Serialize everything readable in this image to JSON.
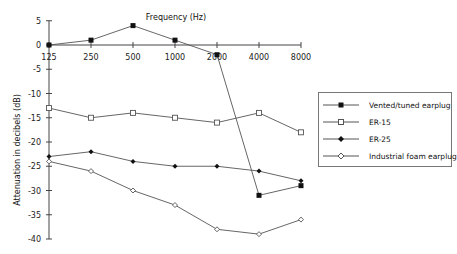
{
  "chart_data": {
    "type": "line",
    "title": "Frequency (Hz)",
    "xlabel": "Frequency (Hz)",
    "ylabel": "Attenuation in decibels (dB)",
    "categories": [
      "125",
      "250",
      "500",
      "1000",
      "2000",
      "4000",
      "8000"
    ],
    "y_ticks": [
      "5",
      "0",
      "-5",
      "-10",
      "-15",
      "-20",
      "-25",
      "-30",
      "-35",
      "-40"
    ],
    "ylim": [
      -40,
      5
    ],
    "grid": false,
    "legend_position": "right",
    "series": [
      {
        "name": "Vented/tuned earplug",
        "marker": "filled-square",
        "values": [
          0,
          1,
          4,
          1,
          -2,
          -31,
          -29
        ]
      },
      {
        "name": "ER-15",
        "marker": "open-square",
        "values": [
          -13,
          -15,
          -14,
          -15,
          -16,
          -14,
          -18
        ]
      },
      {
        "name": "ER-25",
        "marker": "filled-diamond",
        "values": [
          -23,
          -22,
          -24,
          -25,
          -25,
          -26,
          -28
        ]
      },
      {
        "name": "Industrial foam earplug",
        "marker": "open-diamond",
        "values": [
          -24,
          -26,
          -30,
          -33,
          -38,
          -39,
          -36
        ]
      }
    ]
  },
  "legend": {
    "items": [
      {
        "label": "Vented/tuned earplug"
      },
      {
        "label": "ER-15"
      },
      {
        "label": "ER-25"
      },
      {
        "label": "Industrial foam earplug"
      }
    ]
  },
  "colors": {
    "line": "#555555",
    "axis": "#444444",
    "marker_fill": "#111111"
  }
}
